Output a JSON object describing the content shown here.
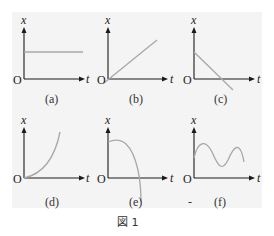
{
  "figure": {
    "caption": "図 1",
    "axis_labels": {
      "x": "x",
      "t": "t",
      "origin": "O"
    },
    "curve_color": "#a8a8a8",
    "axis_color": "#1a1a1a",
    "panels": [
      {
        "id": "a",
        "label": "(a)",
        "shape": "horizontal-line"
      },
      {
        "id": "b",
        "label": "(b)",
        "shape": "increasing-line-through-origin"
      },
      {
        "id": "c",
        "label": "(c)",
        "shape": "decreasing-line"
      },
      {
        "id": "d",
        "label": "(d)",
        "shape": "increasing-concave-up-curve"
      },
      {
        "id": "e",
        "label": "(e)",
        "shape": "decreasing-concave-down-curve"
      },
      {
        "id": "f",
        "label": "(f)",
        "shape": "oscillating-wave"
      }
    ],
    "stray_mark": "-"
  }
}
